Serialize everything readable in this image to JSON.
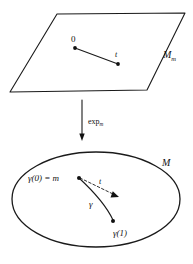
{
  "figure": {
    "ink_color": "#1a1a1a",
    "background_color": "#ffffff"
  },
  "tangent_space": {
    "shape_name": "parallelogram",
    "space_label": "M",
    "space_label_sub": "m",
    "origin_label": "0",
    "vector_label": "t"
  },
  "map_arrow": {
    "label_main": "exp",
    "label_sub": "m",
    "direction": "down"
  },
  "manifold": {
    "shape_name": "ellipse",
    "space_label": "M",
    "start_label": "γ(0) = m",
    "curve_label": "γ",
    "end_label": "γ(1)",
    "tangent_vector_label": "t"
  }
}
